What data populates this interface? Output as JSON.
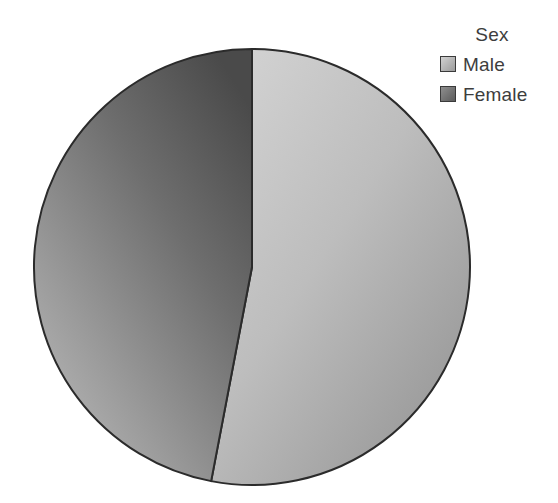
{
  "chart_data": {
    "type": "pie",
    "title": "",
    "legend_title": "Sex",
    "legend_position": "top-right",
    "categories": [
      "Male",
      "Female"
    ],
    "values": [
      53,
      47
    ],
    "units": "percent",
    "start_angle_deg": 0,
    "direction": "clockwise",
    "slices": [
      {
        "label": "Male",
        "value": 53,
        "percent": "53%",
        "start_angle_deg": 0,
        "end_angle_deg": 191,
        "color": "#b0b0b0",
        "gradient_from": "#c9c9c9",
        "gradient_to": "#979797"
      },
      {
        "label": "Female",
        "value": 47,
        "percent": "47%",
        "start_angle_deg": 191,
        "end_angle_deg": 360,
        "color": "#7d7d7d",
        "gradient_from": "#4f4f4f",
        "gradient_to": "#b4b4b4"
      }
    ],
    "grid": false,
    "xlabel": "",
    "ylabel": ""
  },
  "legend": {
    "title": "Sex",
    "items": [
      {
        "label": "Male",
        "swatch_from": "#d2d2d2",
        "swatch_to": "#9b9b9b"
      },
      {
        "label": "Female",
        "swatch_from": "#8f8f8f",
        "swatch_to": "#5c5c5c"
      }
    ]
  },
  "style": {
    "background": "#ffffff",
    "stroke": "#2b2b2b",
    "text_color": "#3d3d3d"
  }
}
